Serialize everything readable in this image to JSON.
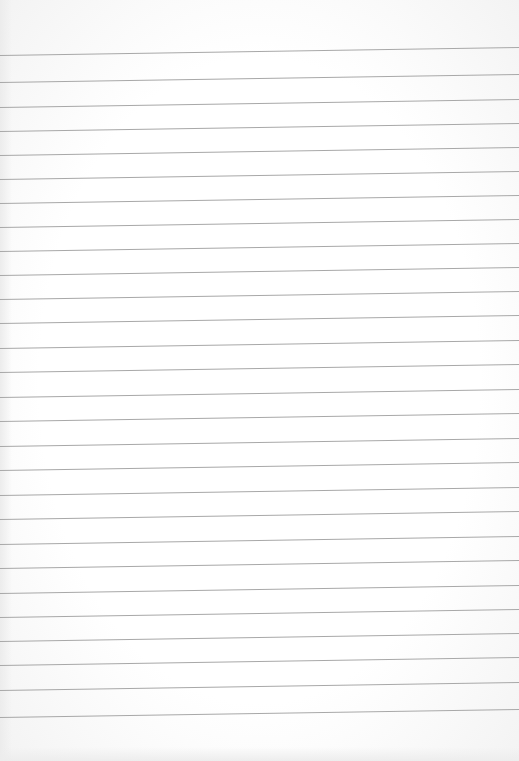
{
  "paper": {
    "type": "ruled-notebook-page",
    "line_color": "#a8a8a8",
    "background_color": "#ffffff",
    "line_count": 28,
    "left_edge_line_y": [
      55,
      82,
      107,
      131,
      155,
      179,
      203,
      227,
      251,
      275,
      299,
      323,
      348,
      372,
      397,
      421,
      446,
      470,
      495,
      519,
      544,
      568,
      593,
      617,
      641,
      665,
      690,
      717
    ],
    "right_edge_offset_y": -8
  }
}
